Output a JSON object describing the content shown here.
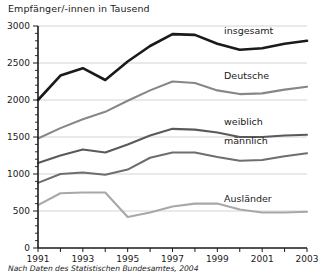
{
  "chart_data": {
    "type": "line",
    "title": "Empfänger/-innen in Tausend",
    "subtitle": "",
    "xlabel": "",
    "ylabel": "",
    "source_note": "Nach Daten des Statistischen Bundesamtes, 2004",
    "grid": true,
    "legend_position": "inline-right",
    "xlim": [
      1991,
      2003
    ],
    "ylim": [
      0,
      3000
    ],
    "yticks": [
      0,
      500,
      1000,
      1500,
      2000,
      2500,
      3000
    ],
    "ytick_labels": [
      "0",
      "500",
      "1000",
      "1500",
      "2000",
      "2500",
      "3000"
    ],
    "xticks": [
      1991,
      1992,
      1993,
      1994,
      1995,
      1996,
      1997,
      1998,
      1999,
      2000,
      2001,
      2002,
      2003
    ],
    "xtick_labels_shown": [
      "1991",
      "1993",
      "1995",
      "1997",
      "1999",
      "2001",
      "2003"
    ],
    "x": [
      1991,
      1992,
      1993,
      1994,
      1995,
      1996,
      1997,
      1998,
      1999,
      2000,
      2001,
      2002,
      2003
    ],
    "series": [
      {
        "name": "insgesamt",
        "color": "#1a1a1a",
        "width": 2.6,
        "label_x": 1999.3,
        "label_y": 2890,
        "values": [
          2000,
          2330,
          2430,
          2270,
          2520,
          2730,
          2890,
          2880,
          2760,
          2680,
          2700,
          2760,
          2800
        ]
      },
      {
        "name": "Deutsche",
        "color": "#878787",
        "width": 2.1,
        "label_x": 1999.3,
        "label_y": 2280,
        "values": [
          1480,
          1620,
          1740,
          1840,
          1990,
          2130,
          2250,
          2230,
          2130,
          2080,
          2090,
          2140,
          2180
        ]
      },
      {
        "name": "weiblich",
        "color": "#5a5a5a",
        "width": 2.1,
        "label_x": 1999.3,
        "label_y": 1660,
        "values": [
          1150,
          1250,
          1330,
          1290,
          1400,
          1520,
          1610,
          1600,
          1560,
          1500,
          1500,
          1520,
          1530
        ]
      },
      {
        "name": "männlich",
        "color": "#6e6e6e",
        "width": 2.1,
        "label_x": 1999.3,
        "label_y": 1400,
        "values": [
          880,
          1000,
          1020,
          990,
          1060,
          1220,
          1290,
          1290,
          1230,
          1180,
          1190,
          1240,
          1280
        ]
      },
      {
        "name": "Ausländer",
        "color": "#a8a8a8",
        "width": 2.1,
        "label_x": 1999.3,
        "label_y": 620,
        "values": [
          580,
          740,
          750,
          750,
          420,
          480,
          560,
          600,
          600,
          520,
          480,
          480,
          490
        ]
      }
    ]
  }
}
